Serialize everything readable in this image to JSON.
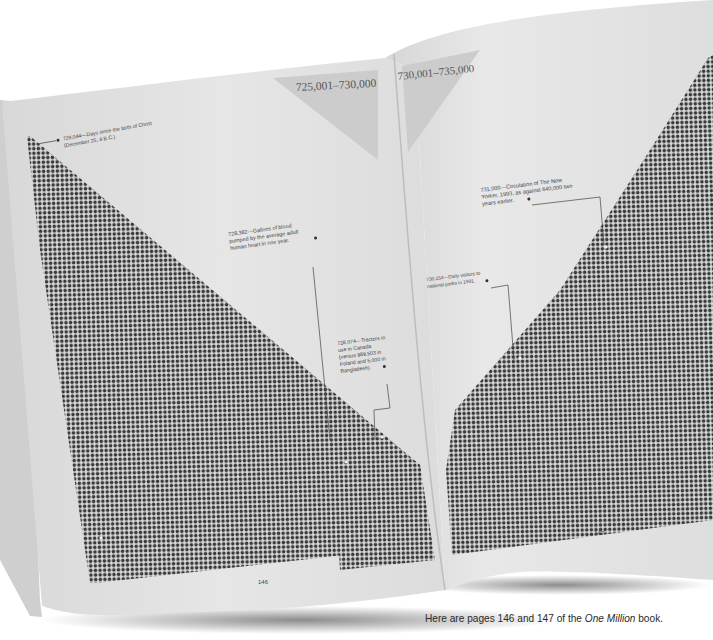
{
  "book": {
    "title": "One Million",
    "left_page": {
      "range_label": "725,001–730,000",
      "page_number": "146",
      "annotations": [
        {
          "line1": "729,044—Days since the birth of Christ",
          "line2": "(December 25, 4 B.C.)"
        },
        {
          "line1": "728,382—Gallons of blood",
          "line2": "pumped by the average adult",
          "line3": "human heart in one year."
        },
        {
          "line1": "728,074—Tractors in",
          "line2": "use in Canada",
          "line3": "(versus 989,503 in",
          "line4": "Poland and 5,000 in",
          "line5": "Bangladesh)."
        }
      ]
    },
    "right_page": {
      "range_label": "730,001–735,000",
      "page_number": "147",
      "annotations": [
        {
          "line1": "731,000—Circulation of The New",
          "line2": "Yorker, 1993, as against 640,000 two",
          "line3": "years earlier."
        },
        {
          "line1": "730,154—Daily visitors to",
          "line2": "national parks in 1991."
        }
      ]
    }
  },
  "caption": {
    "prefix": "Here are pages 146 and 147 of the ",
    "italic": "One Million",
    "suffix": " book."
  },
  "colors": {
    "background": "#ffffff",
    "page": "#e4e4e4",
    "dot": "#3a3a3a",
    "range_triangle": "#cfcfcf"
  }
}
